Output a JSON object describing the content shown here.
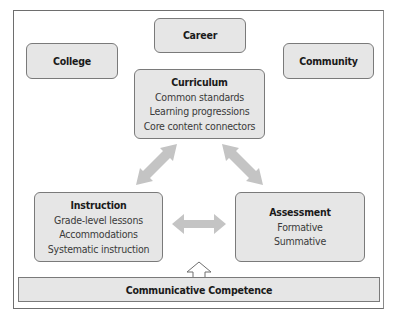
{
  "diagram": {
    "outer_context": [
      {
        "id": "college",
        "label": "College"
      },
      {
        "id": "career",
        "label": "Career"
      },
      {
        "id": "community",
        "label": "Community"
      }
    ],
    "curriculum": {
      "title": "Curriculum",
      "items": [
        "Common standards",
        "Learning progressions",
        "Core content connectors"
      ]
    },
    "instruction": {
      "title": "Instruction",
      "items": [
        "Grade-level lessons",
        "Accommodations",
        "Systematic instruction"
      ]
    },
    "assessment": {
      "title": "Assessment",
      "items": [
        "Formative",
        "Summative"
      ]
    },
    "foundation": {
      "label": "Communicative Competence"
    },
    "connections": [
      {
        "from": "curriculum",
        "to": "instruction",
        "type": "bidirectional"
      },
      {
        "from": "curriculum",
        "to": "assessment",
        "type": "bidirectional"
      },
      {
        "from": "instruction",
        "to": "assessment",
        "type": "bidirectional"
      },
      {
        "from": "foundation",
        "to": "center",
        "type": "up-arrow-outline"
      }
    ],
    "colors": {
      "box_fill": "#e6e6e6",
      "box_border": "#7a7a7a",
      "arrow_fill": "#c4c4c4",
      "frame_border": "#6e6e6e"
    }
  }
}
